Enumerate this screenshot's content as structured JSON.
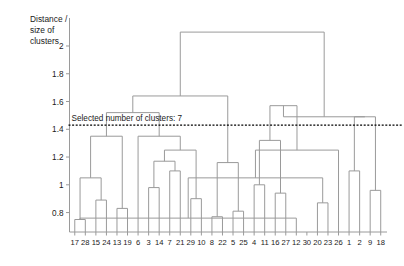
{
  "chart_data": {
    "type": "dendrogram",
    "title": "",
    "xlabel": "",
    "ylabel": "Distance / size of clusters",
    "ylabel_lines": [
      "Distance /",
      "size of",
      "clusters"
    ],
    "ylim": [
      0.66,
      2.18
    ],
    "yticks": [
      0.8,
      1,
      1.2,
      1.4,
      1.6,
      1.8,
      2
    ],
    "ytick_labels": [
      "0.8",
      "1",
      "1.2",
      "1.4",
      "1.6",
      "1.8",
      "2"
    ],
    "grid": false,
    "legend": "none",
    "leaf_labels": [
      "17",
      "28",
      "15",
      "24",
      "13",
      "19",
      "6",
      "3",
      "14",
      "7",
      "21",
      "29",
      "10",
      "8",
      "22",
      "5",
      "25",
      "4",
      "11",
      "16",
      "27",
      "12",
      "30",
      "20",
      "23",
      "26",
      "1",
      "2",
      "9",
      "18"
    ],
    "n_leaves": 30,
    "annotation": {
      "text": "Selected number of clusters: 7",
      "cut_height": 1.43,
      "n_clusters": 7,
      "line_style": "dotted",
      "line_color": "#000000"
    },
    "link_color": "#9a9a9a",
    "merges": [
      {
        "id": 30,
        "left": "17",
        "right": "28",
        "height": 0.75
      },
      {
        "id": 31,
        "left": "15",
        "right": "24",
        "height": 0.89
      },
      {
        "id": 32,
        "left": 30,
        "right": 31,
        "height": 1.05
      },
      {
        "id": 33,
        "left": "13",
        "right": "19",
        "height": 0.83
      },
      {
        "id": 34,
        "left": 32,
        "right": 33,
        "height": 1.35
      },
      {
        "id": 35,
        "left": "3",
        "right": "14",
        "height": 0.98
      },
      {
        "id": 36,
        "left": "7",
        "right": "21",
        "height": 1.1
      },
      {
        "id": 37,
        "left": 35,
        "right": 36,
        "height": 1.17
      },
      {
        "id": 38,
        "left": "29",
        "right": "10",
        "height": 0.9
      },
      {
        "id": 39,
        "left": 37,
        "right": 38,
        "height": 1.25
      },
      {
        "id": 40,
        "left": 39,
        "right": "6",
        "height": 1.35
      },
      {
        "id": 41,
        "left": 34,
        "right": 40,
        "height": 1.52
      },
      {
        "id": 42,
        "left": "8",
        "right": "22",
        "height": 0.77
      },
      {
        "id": 43,
        "left": "5",
        "right": "25",
        "height": 0.81
      },
      {
        "id": 44,
        "left": 42,
        "right": 43,
        "height": 1.16
      },
      {
        "id": 45,
        "left": 41,
        "right": 44,
        "height": 1.64
      },
      {
        "id": 46,
        "left": "4",
        "right": "11",
        "height": 1.0
      },
      {
        "id": 47,
        "left": "16",
        "right": "27",
        "height": 0.94
      },
      {
        "id": 48,
        "left": 46,
        "right": 47,
        "height": 1.32
      },
      {
        "id": 49,
        "left": "12",
        "right": "30",
        "height": 0.76
      },
      {
        "id": 50,
        "left": "20",
        "right": "23",
        "height": 0.87
      },
      {
        "id": 51,
        "left": 49,
        "right": 50,
        "height": 1.05
      },
      {
        "id": 52,
        "left": 51,
        "right": "26",
        "height": 1.25
      },
      {
        "id": 53,
        "left": 48,
        "right": 52,
        "height": 1.57
      },
      {
        "id": 54,
        "left": "1",
        "right": "2",
        "height": 1.1
      },
      {
        "id": 55,
        "left": "9",
        "right": "18",
        "height": 0.96
      },
      {
        "id": 56,
        "left": 54,
        "right": 55,
        "height": 1.49
      },
      {
        "id": 57,
        "left": 53,
        "right": 56,
        "height": 1.49
      },
      {
        "id": 58,
        "left": 45,
        "right": 57,
        "height": 2.1
      }
    ]
  }
}
